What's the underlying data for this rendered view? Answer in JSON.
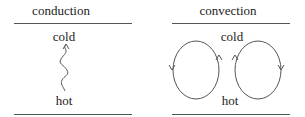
{
  "panels": [
    {
      "title": "conduction",
      "top_label": "cold",
      "bottom_label": "hot"
    },
    {
      "title": "convection",
      "top_label": "cold",
      "bottom_label": "hot"
    }
  ],
  "colors": {
    "line": "#555555",
    "text": "#222222"
  }
}
